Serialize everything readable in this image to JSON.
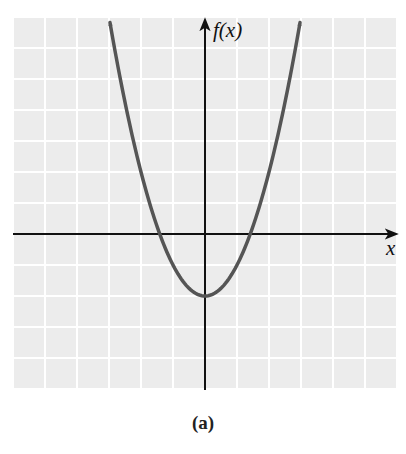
{
  "chart_data": {
    "type": "line",
    "title": "",
    "caption": "(a)",
    "xlabel": "x",
    "ylabel": "f(x)",
    "function": "f(x) = x^2 - 2",
    "grid": true,
    "tick_labels": false,
    "xlim": [
      -6,
      6
    ],
    "ylim": [
      -5,
      7
    ],
    "series": [
      {
        "name": "f(x)",
        "x": [
          -2.97,
          -2.5,
          -2,
          -1.5,
          -1.414,
          -1,
          -0.5,
          0,
          0.5,
          1,
          1.414,
          1.5,
          2,
          2.5,
          2.97
        ],
        "y": [
          6.82,
          4.25,
          2,
          0.25,
          0,
          -1,
          -1.75,
          -2,
          -1.75,
          -1,
          0,
          0.25,
          2,
          4.25,
          6.82
        ]
      }
    ],
    "annotations": {
      "vertex": [
        0,
        -2
      ],
      "x_intercepts": [
        -1.414,
        1.414
      ],
      "both_ends_arrows": true
    }
  },
  "style": {
    "grid_fill": "#ececec",
    "grid_line": "#ffffff",
    "axis_color": "#111111",
    "curve_color": "#555555"
  },
  "labels": {
    "y_axis": "f(x)",
    "x_axis": "x",
    "caption": "(a)"
  }
}
